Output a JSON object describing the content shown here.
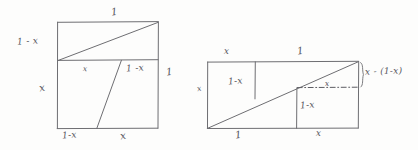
{
  "figure": {
    "ink_color": "#6e6e72",
    "paper_color": "#fdfdfc"
  },
  "left_diagram": {
    "name": "unit-square-dissection",
    "labels": {
      "top": "1",
      "left_upper": "1 - x",
      "left_lower": "x",
      "right_side": "1",
      "interior_left": "x",
      "interior_right": "1 -x",
      "bottom_left": "1-x",
      "bottom_right": "x"
    }
  },
  "right_diagram": {
    "name": "rectangle-dissection",
    "labels": {
      "top_left": "x",
      "top_right": "1",
      "left_side": "x",
      "interior_upper": "1-x",
      "interior_lower": "1-x",
      "dashed_line": "x",
      "bracket": "x - (1-x)",
      "bottom_left": "1",
      "bottom_right": "x"
    }
  }
}
